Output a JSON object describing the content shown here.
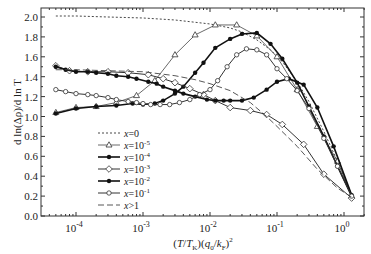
{
  "chart_data": {
    "type": "line",
    "title": "",
    "xlabel": "(T/T_K)(q_0/k_F)^2",
    "ylabel": "d ln(Δρ)/d ln T",
    "xscale": "log",
    "xlim": [
      3.5e-05,
      2.0
    ],
    "ylim": [
      0.0,
      2.1
    ],
    "x_ticks": [
      {
        "value": 0.0001,
        "label": "10",
        "exp": "-4"
      },
      {
        "value": 0.001,
        "label": "10",
        "exp": "-3"
      },
      {
        "value": 0.01,
        "label": "10",
        "exp": "-2"
      },
      {
        "value": 0.1,
        "label": "10",
        "exp": "-1"
      },
      {
        "value": 1,
        "label": "10",
        "exp": "0"
      }
    ],
    "y_ticks": [
      "0.0",
      "0.2",
      "0.4",
      "0.6",
      "0.8",
      "1.0",
      "1.2",
      "1.4",
      "1.6",
      "1.8",
      "2.0"
    ],
    "grid": false,
    "legend_position": "lower left (inside)",
    "series": [
      {
        "name": "x=0",
        "label_base": "x=0",
        "label_exp": "",
        "style": "dotted",
        "marker": "none",
        "x": [
          5e-05,
          0.0001,
          0.0003,
          0.001,
          0.003,
          0.01,
          0.02,
          0.03,
          0.05,
          0.08,
          0.12,
          0.2,
          0.3,
          0.5,
          0.8,
          1.3
        ],
        "y": [
          2.01,
          2.01,
          2.0,
          1.99,
          1.97,
          1.93,
          1.89,
          1.85,
          1.77,
          1.67,
          1.55,
          1.35,
          1.15,
          0.85,
          0.55,
          0.22
        ]
      },
      {
        "name": "x=1e-5",
        "label_base": "x=10",
        "label_exp": "-5",
        "style": "solid-thin",
        "marker": "open-triangle",
        "x": [
          5e-05,
          0.0001,
          0.0002,
          0.0004,
          0.0008,
          0.0015,
          0.003,
          0.006,
          0.012,
          0.025,
          0.05,
          0.1,
          0.2,
          0.4,
          0.8,
          1.3
        ],
        "y": [
          1.04,
          1.09,
          1.1,
          1.14,
          1.21,
          1.36,
          1.62,
          1.82,
          1.92,
          1.92,
          1.81,
          1.6,
          1.27,
          0.9,
          0.55,
          0.2
        ]
      },
      {
        "name": "x=1e-4",
        "label_base": "x=10",
        "label_exp": "-4",
        "style": "solid-thick",
        "marker": "filled-circle",
        "x": [
          5e-05,
          0.0001,
          0.0002,
          0.0004,
          0.0007,
          0.001,
          0.0015,
          0.002,
          0.003,
          0.004,
          0.006,
          0.008,
          0.012,
          0.02,
          0.03,
          0.05,
          0.08,
          0.12,
          0.2,
          0.3,
          0.5,
          0.8,
          1.3
        ],
        "y": [
          1.03,
          1.08,
          1.1,
          1.11,
          1.13,
          1.12,
          1.13,
          1.16,
          1.23,
          1.3,
          1.44,
          1.54,
          1.69,
          1.78,
          1.83,
          1.84,
          1.73,
          1.58,
          1.34,
          1.1,
          0.8,
          0.5,
          0.2
        ]
      },
      {
        "name": "x=1e-3",
        "label_base": "x=10",
        "label_exp": "-3",
        "style": "solid",
        "marker": "open-diamond",
        "x": [
          5e-05,
          8e-05,
          0.00015,
          0.0003,
          0.0006,
          0.0012,
          0.002,
          0.003,
          0.005,
          0.008,
          0.012,
          0.02,
          0.04,
          0.07,
          0.12,
          0.25,
          0.5,
          1.3
        ],
        "y": [
          1.51,
          1.46,
          1.45,
          1.45,
          1.44,
          1.42,
          1.38,
          1.34,
          1.28,
          1.22,
          1.16,
          1.09,
          1.06,
          1.02,
          0.92,
          0.72,
          0.42,
          0.18
        ]
      },
      {
        "name": "x=1e-2",
        "label_base": "x=10",
        "label_exp": "-2",
        "style": "solid-thick",
        "marker": "filled-circle",
        "x": [
          5e-05,
          7e-05,
          0.0001,
          0.00015,
          0.0002,
          0.0003,
          0.0004,
          0.0006,
          0.0008,
          0.0012,
          0.0016,
          0.002,
          0.003,
          0.004,
          0.006,
          0.009,
          0.012,
          0.016,
          0.02,
          0.03,
          0.045,
          0.07,
          0.1,
          0.15,
          0.25,
          0.4,
          0.7,
          1.3
        ],
        "y": [
          1.5,
          1.47,
          1.45,
          1.45,
          1.44,
          1.43,
          1.41,
          1.4,
          1.38,
          1.35,
          1.33,
          1.3,
          1.26,
          1.23,
          1.2,
          1.17,
          1.16,
          1.16,
          1.16,
          1.16,
          1.19,
          1.27,
          1.35,
          1.38,
          1.32,
          1.09,
          0.7,
          0.21
        ]
      },
      {
        "name": "x=1e-1",
        "label_base": "x=10",
        "label_exp": "-1",
        "style": "solid",
        "marker": "open-circle",
        "x": [
          5e-05,
          7e-05,
          0.0001,
          0.00015,
          0.0002,
          0.0003,
          0.0004,
          0.0006,
          0.0008,
          0.001,
          0.0013,
          0.0018,
          0.0025,
          0.0035,
          0.005,
          0.007,
          0.01,
          0.013,
          0.018,
          0.025,
          0.035,
          0.05,
          0.07,
          0.1,
          0.14,
          0.2,
          0.3,
          0.5,
          0.8,
          1.3
        ],
        "y": [
          1.27,
          1.25,
          1.23,
          1.22,
          1.21,
          1.19,
          1.17,
          1.15,
          1.14,
          1.13,
          1.12,
          1.12,
          1.12,
          1.14,
          1.17,
          1.22,
          1.27,
          1.36,
          1.5,
          1.62,
          1.68,
          1.67,
          1.62,
          1.48,
          1.38,
          1.26,
          1.08,
          0.78,
          0.5,
          0.2
        ]
      },
      {
        "name": "x>1",
        "label_base": "x>1",
        "label_exp": "",
        "style": "dashed",
        "marker": "none",
        "x": [
          5e-05,
          0.0001,
          0.0003,
          0.001,
          0.003,
          0.006,
          0.01,
          0.02,
          0.04,
          0.07,
          0.1,
          0.2,
          0.4,
          0.8,
          1.3
        ],
        "y": [
          1.47,
          1.47,
          1.46,
          1.45,
          1.41,
          1.37,
          1.33,
          1.26,
          1.14,
          1.0,
          0.9,
          0.7,
          0.47,
          0.28,
          0.19
        ]
      }
    ]
  }
}
